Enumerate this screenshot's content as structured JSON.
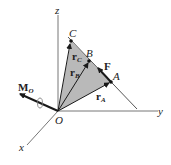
{
  "diagram": {
    "axes": {
      "x": "x",
      "y": "y",
      "z": "z"
    },
    "origin_label": "O",
    "points": {
      "A": "A",
      "B": "B",
      "C": "C"
    },
    "force_label": "F",
    "moment_label": {
      "main": "M",
      "sub": "O"
    },
    "position_vectors": [
      {
        "main": "r",
        "sub": "A"
      },
      {
        "main": "r",
        "sub": "B"
      },
      {
        "main": "r",
        "sub": "C"
      }
    ],
    "colors": {
      "shade": "#b9b9b9",
      "line": "#555555",
      "vector": "#1a1a1a"
    }
  }
}
